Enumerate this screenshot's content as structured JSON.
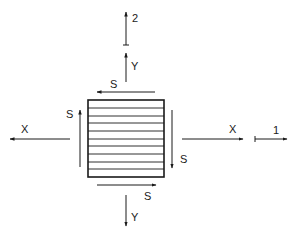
{
  "diagram": {
    "type": "stress-element",
    "element": {
      "shape": "square",
      "hatch": "horizontal-lines",
      "hatch_line_count": 9
    },
    "labels": {
      "axis_2": "2",
      "axis_1": "1",
      "normal_y_top": "Y",
      "normal_y_bottom": "Y",
      "normal_x_left": "X",
      "normal_x_right": "X",
      "shear_top": "S",
      "shear_bottom": "S",
      "shear_left": "S",
      "shear_right": "S"
    },
    "stroke_color": "#1a1a1a",
    "background_color": "#ffffff"
  }
}
